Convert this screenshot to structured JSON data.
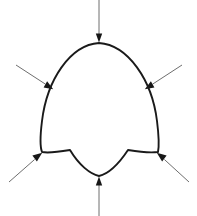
{
  "figure": {
    "name": "reuleaux-triangle-with-inward-arrows",
    "canvas": {
      "width": 197,
      "height": 216,
      "background": "#ffffff"
    },
    "caption": "",
    "title": ""
  },
  "shape": {
    "name": "reuleaux-triangle-outline",
    "type": "constant-width-curved-triangle",
    "stroke_color": "#1a1a1a",
    "stroke_width": 1.9,
    "fill": "none",
    "vertices": [
      {
        "label": "top-vertex",
        "x": 99,
        "y": 43
      },
      {
        "label": "bottom-left-vertex",
        "x": 42,
        "y": 152
      },
      {
        "label": "bottom-right-vertex",
        "x": 158,
        "y": 152
      }
    ],
    "extents": {
      "left": 41,
      "right": 159,
      "top": 42,
      "bottom": 177
    },
    "path": "M 99 43 C 128 45 152 80 157 121 C 159 137 159 147 158 152 C 151 153 140 152 128 150 C 118 165 108 174 99 176 C 90 174 79 165 70 150 C 58 152 47 153 42 152 C 40 147 40 137 42 121 C 47 80 70 45 99 43 Z"
  },
  "arrows": {
    "color_shaft": "#6e6e6e",
    "color_head": "#171717",
    "shaft_width": 1.0,
    "head_length": 9,
    "head_width": 6,
    "count": 6,
    "items": [
      {
        "name": "arrow-top",
        "direction": "down",
        "angle_deg": 90,
        "tail": {
          "x": 99,
          "y": 0
        },
        "tip": {
          "x": 99,
          "y": 42
        },
        "target": "top-vertex"
      },
      {
        "name": "arrow-upper-left",
        "direction": "down-right",
        "angle_deg": 33,
        "tail": {
          "x": 16,
          "y": 65
        },
        "tip": {
          "x": 53,
          "y": 89
        },
        "target": "upper-left-edge"
      },
      {
        "name": "arrow-upper-right",
        "direction": "down-left",
        "angle_deg": 147,
        "tail": {
          "x": 182,
          "y": 65
        },
        "tip": {
          "x": 145,
          "y": 89
        },
        "target": "upper-right-edge"
      },
      {
        "name": "arrow-lower-left",
        "direction": "up-right",
        "angle_deg": -33,
        "tail": {
          "x": 9,
          "y": 182
        },
        "tip": {
          "x": 42,
          "y": 153
        },
        "target": "bottom-left-vertex"
      },
      {
        "name": "arrow-lower-right",
        "direction": "up-left",
        "angle_deg": -147,
        "tail": {
          "x": 189,
          "y": 182
        },
        "tip": {
          "x": 157,
          "y": 153
        },
        "target": "bottom-right-vertex"
      },
      {
        "name": "arrow-bottom",
        "direction": "up",
        "angle_deg": -90,
        "tail": {
          "x": 99,
          "y": 216
        },
        "tip": {
          "x": 99,
          "y": 177
        },
        "target": "bottom-edge-midpoint"
      }
    ]
  }
}
